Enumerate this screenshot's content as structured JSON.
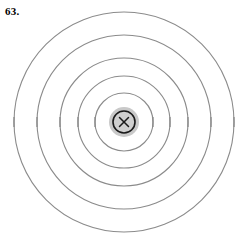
{
  "figure": {
    "problem_number": "63.",
    "description_name": "concentric-magnetic-field-lines-around-wire-into-page",
    "canvas": {
      "width": 243,
      "height": 238
    },
    "center": {
      "x": 124,
      "y": 122
    },
    "colors": {
      "background": "#ffffff",
      "field_line": "#8b8b8b",
      "tick_mark": "#8b8b8b",
      "wire_halo": "#c9c9c9",
      "wire_core_stroke": "#1a1a1a",
      "wire_core_fill": "#cfcfcf",
      "wire_x": "#1a1a1a",
      "label_text": "#000000"
    },
    "field_lines": [
      {
        "name": "field-line-1",
        "radius": 29,
        "stroke_width": 1.1
      },
      {
        "name": "field-line-2",
        "radius": 46,
        "stroke_width": 1.1
      },
      {
        "name": "field-line-3",
        "radius": 64,
        "stroke_width": 1.1
      },
      {
        "name": "field-line-4",
        "radius": 87,
        "stroke_width": 1.1
      },
      {
        "name": "field-line-5",
        "radius": 110,
        "stroke_width": 1.1
      }
    ],
    "tick_marks": {
      "name": "field-line-direction-ticks",
      "half_length": 5,
      "stroke_width": 1.3,
      "angles_degrees": [
        0,
        180
      ]
    },
    "wire": {
      "name": "current-carrying-wire-into-page",
      "halo_radius": 15,
      "core_radius": 11,
      "core_stroke_width": 1.6,
      "x_arm": 4.5,
      "x_stroke_width": 1.5,
      "symbol": "x"
    }
  }
}
